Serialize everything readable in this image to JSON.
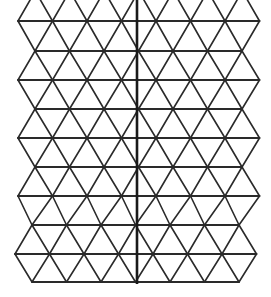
{
  "diagram": {
    "type": "isometric-triangle-grid",
    "stroke_color": "#2a2a2a",
    "axis_color": "#1a1a1a",
    "background": "#ffffff",
    "rows": [
      {
        "y": 21,
        "x_start": 18,
        "count": 8
      },
      {
        "y": 51,
        "x_start": 35,
        "count": 7
      },
      {
        "y": 80,
        "x_start": 18,
        "count": 8
      },
      {
        "y": 109,
        "x_start": 35,
        "count": 7
      },
      {
        "y": 138,
        "x_start": 18,
        "count": 8
      },
      {
        "y": 167,
        "x_start": 35,
        "count": 7
      },
      {
        "y": 196,
        "x_start": 18,
        "count": 8
      },
      {
        "y": 225,
        "x_start": 32,
        "count": 7
      },
      {
        "y": 254,
        "x_start": 15,
        "count": 8
      },
      {
        "y": 282,
        "x_start": 32,
        "count": 7
      }
    ],
    "spacing": 34.5,
    "axis": {
      "x": 137,
      "y_top": 0,
      "y_bottom": 284
    }
  }
}
